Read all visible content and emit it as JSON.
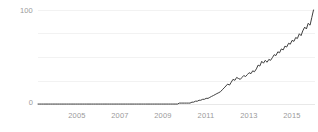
{
  "chart_data": {
    "type": "line",
    "title": "",
    "xlabel": "",
    "ylabel": "Interest Over Time",
    "ylim": [
      0,
      100
    ],
    "xlim": [
      2004.0,
      2016.9
    ],
    "grid": true,
    "legend": false,
    "legend_position": "none",
    "line_color": "#3f3f3f",
    "grid_color": "#f2f2f2",
    "tick_color": "#9a9a9a",
    "yticks": [
      0,
      100
    ],
    "ytick_labels": [
      "0",
      "100"
    ],
    "ygridlines": [
      0,
      25,
      50,
      75,
      100
    ],
    "xticks": [
      2005,
      2007,
      2009,
      2011,
      2013,
      2015
    ],
    "xtick_labels": [
      "2005",
      "2007",
      "2009",
      "2011",
      "2013",
      "2015"
    ],
    "series": [
      {
        "name": "Interest Over Time",
        "x": [
          2004.0,
          2004.08,
          2004.17,
          2004.25,
          2004.33,
          2004.42,
          2004.5,
          2004.58,
          2004.67,
          2004.75,
          2004.83,
          2004.92,
          2005.0,
          2005.08,
          2005.17,
          2005.25,
          2005.33,
          2005.42,
          2005.5,
          2005.58,
          2005.67,
          2005.75,
          2005.83,
          2005.92,
          2006.0,
          2006.08,
          2006.17,
          2006.25,
          2006.33,
          2006.42,
          2006.5,
          2006.58,
          2006.67,
          2006.75,
          2006.83,
          2006.92,
          2007.0,
          2007.08,
          2007.17,
          2007.25,
          2007.33,
          2007.42,
          2007.5,
          2007.58,
          2007.67,
          2007.75,
          2007.83,
          2007.92,
          2008.0,
          2008.08,
          2008.17,
          2008.25,
          2008.33,
          2008.42,
          2008.5,
          2008.58,
          2008.67,
          2008.75,
          2008.83,
          2008.92,
          2009.0,
          2009.08,
          2009.17,
          2009.25,
          2009.33,
          2009.42,
          2009.5,
          2009.58,
          2009.67,
          2009.75,
          2009.83,
          2009.92,
          2010.0,
          2010.08,
          2010.17,
          2010.25,
          2010.33,
          2010.42,
          2010.5,
          2010.58,
          2010.67,
          2010.75,
          2010.83,
          2010.92,
          2011.0,
          2011.08,
          2011.17,
          2011.25,
          2011.33,
          2011.42,
          2011.5,
          2011.58,
          2011.67,
          2011.75,
          2011.83,
          2011.92,
          2012.0,
          2012.08,
          2012.17,
          2012.25,
          2012.33,
          2012.42,
          2012.5,
          2012.58,
          2012.67,
          2012.75,
          2012.83,
          2012.92,
          2013.0,
          2013.08,
          2013.17,
          2013.25,
          2013.33,
          2013.42,
          2013.5,
          2013.58,
          2013.67,
          2013.75,
          2013.83,
          2013.92,
          2014.0,
          2014.08,
          2014.17,
          2014.25,
          2014.33,
          2014.42,
          2014.5,
          2014.58,
          2014.67,
          2014.75,
          2014.83,
          2014.92,
          2015.0,
          2015.08,
          2015.17,
          2015.25,
          2015.33,
          2015.42,
          2015.5,
          2015.58,
          2015.67,
          2015.75,
          2015.83,
          2015.92,
          2016.0,
          2016.08,
          2016.17,
          2016.25,
          2016.33,
          2016.42,
          2016.5,
          2016.58,
          2016.67,
          2016.75,
          2016.83
        ],
        "values": [
          1,
          1,
          1,
          1,
          1,
          1,
          1,
          1,
          1,
          1,
          1,
          1,
          1,
          1,
          1,
          1,
          1,
          1,
          1,
          1,
          1,
          1,
          1,
          1,
          1,
          1,
          1,
          1,
          1,
          1,
          1,
          1,
          1,
          1,
          1,
          1,
          1,
          1,
          1,
          1,
          1,
          1,
          1,
          1,
          1,
          1,
          1,
          1,
          1,
          1,
          1,
          1,
          1,
          1,
          1,
          1,
          1,
          1,
          1,
          1,
          1,
          1,
          1,
          1,
          1,
          1,
          1,
          1,
          1,
          1,
          1,
          1,
          1,
          1,
          1,
          1,
          1,
          1,
          1,
          2,
          2,
          2,
          2,
          2,
          2,
          2,
          3,
          3,
          4,
          4,
          5,
          5,
          6,
          6,
          7,
          7,
          8,
          9,
          10,
          11,
          12,
          13,
          14,
          16,
          18,
          20,
          22,
          21,
          24,
          27,
          26,
          29,
          28,
          27,
          29,
          31,
          30,
          32,
          34,
          33,
          36,
          35,
          38,
          42,
          41,
          46,
          44,
          47,
          45,
          48,
          47,
          50,
          53,
          52,
          56,
          55,
          59,
          58,
          62,
          61,
          65,
          64,
          68,
          67,
          71,
          70,
          75,
          73,
          78,
          82,
          80,
          86,
          84,
          92,
          100
        ]
      }
    ]
  },
  "axis": {
    "y_label": "Interest Over Time",
    "y_top_label": "100",
    "y_bottom_label": "0"
  }
}
